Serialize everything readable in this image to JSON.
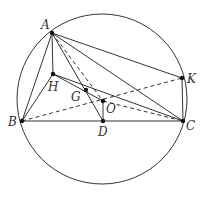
{
  "diagram": {
    "type": "geometry-circumcircle",
    "circle": {
      "cx": 102,
      "cy": 99,
      "r": 85
    },
    "points": {
      "A": {
        "x": 52,
        "y": 33,
        "label": "A",
        "lx": 41,
        "ly": 29
      },
      "H": {
        "x": 53,
        "y": 74,
        "label": "H",
        "lx": 48,
        "ly": 91
      },
      "B": {
        "x": 22,
        "y": 121,
        "label": "B",
        "lx": 8,
        "ly": 126
      },
      "C": {
        "x": 183,
        "y": 121,
        "label": "C",
        "lx": 186,
        "ly": 130
      },
      "K": {
        "x": 182,
        "y": 78,
        "label": "K",
        "lx": 187,
        "ly": 83
      },
      "D": {
        "x": 103,
        "y": 121,
        "label": "D",
        "lx": 98,
        "ly": 136
      },
      "O": {
        "x": 103,
        "y": 101,
        "label": "O",
        "lx": 106,
        "ly": 113
      },
      "G": {
        "x": 86,
        "y": 90,
        "label": "G",
        "lx": 71,
        "ly": 101
      }
    },
    "solid_segments": [
      [
        "A",
        "B"
      ],
      [
        "A",
        "H"
      ],
      [
        "A",
        "K"
      ],
      [
        "A",
        "C"
      ],
      [
        "A",
        "D"
      ],
      [
        "H",
        "B"
      ],
      [
        "H",
        "O"
      ],
      [
        "H",
        "C"
      ],
      [
        "B",
        "C"
      ],
      [
        "K",
        "C"
      ],
      [
        "O",
        "D"
      ]
    ],
    "dashed_segments": [
      [
        "A",
        "O"
      ],
      [
        "O",
        "C"
      ],
      [
        "B",
        "K"
      ]
    ],
    "stroke_color": "#333333"
  }
}
